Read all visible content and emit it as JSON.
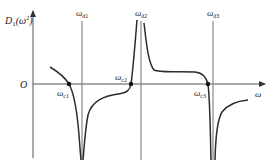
{
  "diagram": {
    "y_axis_label": {
      "main": "D",
      "sub": "1",
      "arg": "(ω",
      "sup": "2",
      "close": ")"
    },
    "x_axis_label": "ω",
    "origin_label": "O",
    "asymptotes": [
      {
        "id": "d1",
        "label": "ω",
        "sub": "d1"
      },
      {
        "id": "d2",
        "label": "ω",
        "sub": "d2"
      },
      {
        "id": "d3",
        "label": "ω",
        "sub": "d3"
      }
    ],
    "zero_crossings": [
      {
        "id": "c1",
        "label": "ω",
        "sub": "c1"
      },
      {
        "id": "c2",
        "label": "ω",
        "sub": "c2"
      },
      {
        "id": "c3",
        "label": "ω",
        "sub": "c3"
      }
    ],
    "colors": {
      "curve": "#2b2b2b",
      "axis": "#555555",
      "asymptote": "#888888"
    }
  }
}
